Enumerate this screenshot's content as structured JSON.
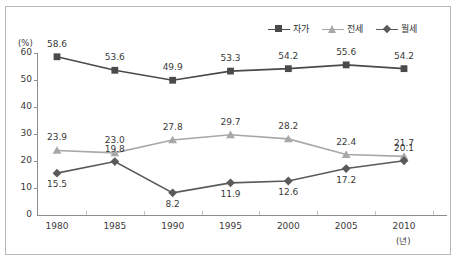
{
  "chart_data": {
    "type": "line",
    "title": "",
    "xlabel": "(년)",
    "ylabel": "(%)",
    "x": [
      1980,
      1985,
      1990,
      1995,
      2000,
      2005,
      2010
    ],
    "categories": [
      "1980",
      "1985",
      "1990",
      "1995",
      "2000",
      "2005",
      "2010"
    ],
    "ylim": [
      0,
      60
    ],
    "yticks": [
      0,
      10,
      20,
      30,
      40,
      50,
      60
    ],
    "ytick_labels": [
      "0",
      "10",
      "20",
      "30",
      "40",
      "50",
      "60"
    ],
    "grid": false,
    "legend_position": "top-right",
    "series": [
      {
        "name": "자가",
        "marker": "square",
        "color": "#4a4a4a",
        "values": [
          58.6,
          53.6,
          49.9,
          53.3,
          54.2,
          55.6,
          54.2
        ],
        "labels": [
          "58.6",
          "53.6",
          "49.9",
          "53.3",
          "54.2",
          "55.6",
          "54.2"
        ]
      },
      {
        "name": "전세",
        "marker": "triangle",
        "color": "#a8a8a8",
        "values": [
          23.9,
          23.0,
          27.8,
          29.7,
          28.2,
          22.4,
          21.7
        ],
        "labels": [
          "23.9",
          "23.0",
          "27.8",
          "29.7",
          "28.2",
          "22.4",
          "21.7"
        ]
      },
      {
        "name": "월세",
        "marker": "diamond",
        "color": "#5a5a5a",
        "values": [
          15.5,
          19.8,
          8.2,
          11.9,
          12.6,
          17.2,
          20.1
        ],
        "labels": [
          "15.5",
          "19.8",
          "8.2",
          "11.9",
          "12.6",
          "17.2",
          "20.1"
        ]
      }
    ]
  },
  "legend": {
    "items": [
      {
        "label": "자가"
      },
      {
        "label": "전세"
      },
      {
        "label": "월세"
      }
    ]
  }
}
